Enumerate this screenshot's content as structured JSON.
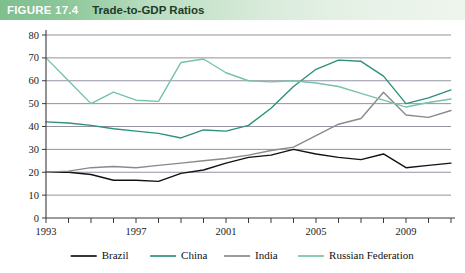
{
  "header": {
    "badge": "FIGURE 17.4",
    "title": "Trade-to-GDP Ratios",
    "band_color_left": "#7fbf8e",
    "band_color_right": "#eef5ed",
    "badge_color": "#ffffff",
    "title_color": "#1d3b28"
  },
  "chart_data": {
    "type": "line",
    "title": "Trade-to-GDP Ratios",
    "xlabel": "",
    "ylabel": "",
    "ylim": [
      0,
      80
    ],
    "xlim": [
      1993,
      2011
    ],
    "ytick_step": 10,
    "yticks": [
      0,
      10,
      20,
      30,
      40,
      50,
      60,
      70,
      80
    ],
    "ytick_labels": [
      "0",
      "10",
      "20",
      "30",
      "40",
      "50",
      "60",
      "70",
      "80"
    ],
    "x": [
      1993,
      1994,
      1995,
      1996,
      1997,
      1998,
      1999,
      2000,
      2001,
      2002,
      2003,
      2004,
      2005,
      2006,
      2007,
      2008,
      2009,
      2010,
      2011
    ],
    "xtick_labels_shown": [
      "1993",
      "1997",
      "2001",
      "2005",
      "2009"
    ],
    "xtick_label_years": [
      1993,
      1997,
      2001,
      2005,
      2009
    ],
    "grid": true,
    "grid_axis": "y",
    "legend_position": "bottom",
    "series": [
      {
        "name": "Brazil",
        "color": "#121212",
        "values": [
          20,
          20,
          19,
          16.5,
          16.5,
          16,
          19.5,
          21,
          24,
          26.5,
          27.5,
          30,
          28,
          26.5,
          25.5,
          28,
          22,
          23,
          24
        ]
      },
      {
        "name": "China",
        "color": "#2f8f7c",
        "values": [
          42,
          41.5,
          40.5,
          39,
          38,
          37,
          35,
          38.5,
          38,
          40.5,
          48,
          57.5,
          65,
          69,
          68.5,
          62,
          50,
          52.5,
          56
        ]
      },
      {
        "name": "India",
        "color": "#8a8a8a",
        "values": [
          20,
          20.5,
          22,
          22.5,
          22,
          23,
          24,
          25,
          26,
          27.5,
          29.5,
          31,
          36,
          41,
          43.5,
          55,
          45,
          44,
          47
        ]
      },
      {
        "name": "Russian Federation",
        "color": "#77c2a8",
        "values": [
          70,
          60,
          50,
          55,
          51.5,
          51,
          68,
          69.5,
          63.5,
          60,
          59.5,
          60,
          59,
          57.5,
          54.5,
          51.5,
          48.5,
          50.5,
          52
        ]
      }
    ]
  },
  "legend": {
    "items": [
      {
        "label": "Brazil",
        "color": "#121212"
      },
      {
        "label": "China",
        "color": "#2f8f7c"
      },
      {
        "label": "India",
        "color": "#8a8a8a"
      },
      {
        "label": "Russian Federation",
        "color": "#77c2a8"
      }
    ]
  }
}
